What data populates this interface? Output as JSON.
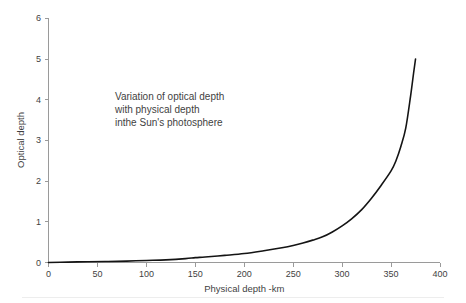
{
  "chart_data": {
    "type": "line",
    "title": "",
    "xlabel": "Physical depth -km",
    "ylabel": "Optical depth",
    "xlim": [
      0,
      400
    ],
    "ylim": [
      0,
      6
    ],
    "grid": false,
    "legend": null,
    "xticks": [
      "0",
      "50",
      "100",
      "150",
      "200",
      "250",
      "300",
      "350",
      "400"
    ],
    "xtick_values": [
      0,
      50,
      100,
      150,
      200,
      250,
      300,
      350,
      400
    ],
    "yticks": [
      "0",
      "1",
      "2",
      "3",
      "4",
      "5",
      "6"
    ],
    "ytick_values": [
      0,
      1,
      2,
      3,
      4,
      5,
      6
    ],
    "annotations": [
      {
        "name": "curve-description",
        "lines": [
          "Variation of optical depth",
          "with physical depth",
          "inthe Sun's photosphere"
        ],
        "x": 95,
        "y": 4.0
      }
    ],
    "series": [
      {
        "name": "optical depth",
        "color": "#141414",
        "x": [
          0,
          20,
          40,
          60,
          80,
          100,
          120,
          140,
          150,
          160,
          180,
          200,
          220,
          240,
          250,
          260,
          270,
          280,
          290,
          300,
          310,
          320,
          330,
          340,
          350,
          355,
          360,
          365,
          370,
          373,
          375
        ],
        "y": [
          0.0,
          0.01,
          0.02,
          0.025,
          0.035,
          0.05,
          0.065,
          0.095,
          0.12,
          0.135,
          0.175,
          0.22,
          0.29,
          0.37,
          0.42,
          0.48,
          0.55,
          0.63,
          0.75,
          0.9,
          1.08,
          1.3,
          1.58,
          1.9,
          2.25,
          2.5,
          2.85,
          3.3,
          4.1,
          4.65,
          5.0
        ]
      }
    ]
  },
  "axes": {
    "y_axis_title": "Optical depth",
    "x_axis_title": "Physical depth -km"
  }
}
